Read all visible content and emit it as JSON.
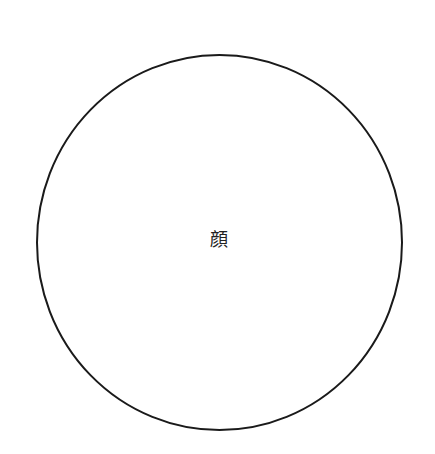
{
  "diagram": {
    "shape": "circle",
    "label": "顔",
    "stroke_color": "#1a1a1a",
    "fill_color": "#ffffff"
  }
}
